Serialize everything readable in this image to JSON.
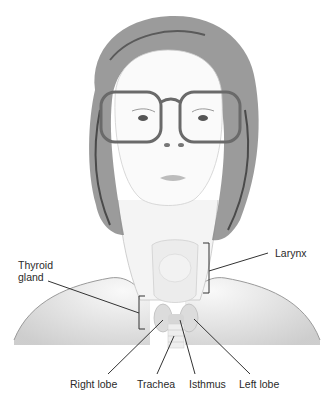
{
  "diagram": {
    "labels": {
      "thyroid_gland_line1": "Thyroid",
      "thyroid_gland_line2": "gland",
      "larynx": "Larynx",
      "right_lobe": "Right lobe",
      "trachea": "Trachea",
      "isthmus": "Isthmus",
      "left_lobe": "Left lobe"
    },
    "colors": {
      "line": "#333333",
      "text": "#2a2a2a",
      "hair": "#6e6e6e",
      "skin_shade": "#d6d6d6",
      "background": "#ffffff"
    }
  }
}
